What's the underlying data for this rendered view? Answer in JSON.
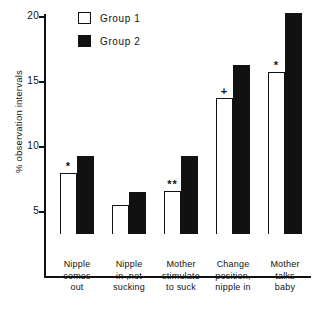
{
  "chart_data": {
    "type": "bar",
    "title": "",
    "xlabel": "",
    "ylabel": "% observation intervals",
    "ylim": [
      0,
      20
    ],
    "yticks": [
      5,
      10,
      15,
      20
    ],
    "ytick_labels": [
      "5",
      "10",
      "15",
      "20"
    ],
    "grid": false,
    "legend_position": "top-left",
    "categories": [
      "Nipple comes out",
      "Nipple in , not sucking",
      "Mother stimulate to suck",
      "Change position, nipple in",
      "Mother talks baby"
    ],
    "category_lines": [
      [
        "Nipple",
        "comes",
        "out"
      ],
      [
        "Nipple",
        "in ,not",
        "sucking"
      ],
      [
        "Mother",
        "stimulate",
        "to suck"
      ],
      [
        "Change",
        "position,",
        "nipple in"
      ],
      [
        "Mother",
        "talks",
        "baby"
      ]
    ],
    "series": [
      {
        "name": "Group 1",
        "fill": "#ffffff",
        "values": [
          4.7,
          2.2,
          3.3,
          10.5,
          12.5
        ],
        "annotations": [
          "*",
          "",
          "**",
          "+",
          "*"
        ]
      },
      {
        "name": "Group 2",
        "fill": "#111111",
        "values": [
          6.0,
          3.2,
          6.0,
          13.0,
          17.0
        ],
        "annotations": [
          "",
          "",
          "",
          "",
          ""
        ]
      }
    ]
  },
  "legend": {
    "items": [
      {
        "label": "Group 1",
        "style": "open"
      },
      {
        "label": "Group 2",
        "style": "filled"
      }
    ]
  },
  "axis": {
    "y_title": "% observation intervals",
    "tick_20": "20",
    "tick_15": "15",
    "tick_10": "10",
    "tick_5": "5"
  }
}
